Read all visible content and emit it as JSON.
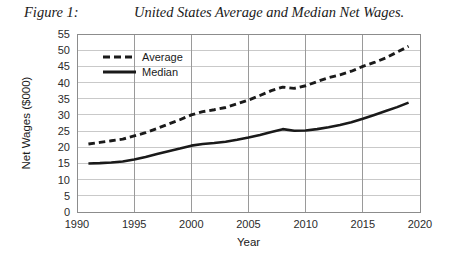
{
  "figure": {
    "label": "Figure 1:",
    "title": "United States Average and Median Net Wages."
  },
  "chart_data": {
    "type": "line",
    "title": "United States Average and Median Net Wages.",
    "xlabel": "Year",
    "ylabel": "Net Wages ($000)",
    "xlim": [
      1990,
      2020
    ],
    "ylim": [
      0,
      55
    ],
    "xticks": [
      1990,
      1995,
      2000,
      2005,
      2010,
      2015,
      2020
    ],
    "yticks": [
      0,
      5,
      10,
      15,
      20,
      25,
      30,
      35,
      40,
      45,
      50,
      55
    ],
    "grid": "both",
    "legend_position": "upper-left-inside",
    "x": [
      1991,
      1992,
      1993,
      1994,
      1995,
      1996,
      1997,
      1998,
      1999,
      2000,
      2001,
      2002,
      2003,
      2004,
      2005,
      2006,
      2007,
      2008,
      2009,
      2010,
      2011,
      2012,
      2013,
      2014,
      2015,
      2016,
      2017,
      2018,
      2019
    ],
    "series": [
      {
        "name": "Average",
        "style": "dashed",
        "color": "#1a1a1a",
        "values": [
          21.0,
          21.5,
          22.0,
          22.5,
          23.5,
          24.5,
          25.8,
          27.2,
          28.5,
          30.0,
          31.0,
          31.6,
          32.3,
          33.4,
          34.6,
          36.0,
          37.5,
          38.6,
          38.2,
          39.0,
          40.3,
          41.5,
          42.4,
          43.5,
          45.0,
          46.2,
          47.6,
          49.4,
          51.2
        ]
      },
      {
        "name": "Median",
        "style": "solid",
        "color": "#1a1a1a",
        "values": [
          15.0,
          15.1,
          15.3,
          15.6,
          16.2,
          17.0,
          17.9,
          18.8,
          19.6,
          20.5,
          21.0,
          21.3,
          21.7,
          22.3,
          23.0,
          23.8,
          24.7,
          25.6,
          25.1,
          25.2,
          25.6,
          26.2,
          26.9,
          27.7,
          28.8,
          30.0,
          31.2,
          32.4,
          33.8
        ]
      }
    ]
  },
  "legend": {
    "items": [
      {
        "label": "Average",
        "style": "dashed"
      },
      {
        "label": "Median",
        "style": "solid"
      }
    ]
  },
  "colors": {
    "line": "#1a1a1a",
    "grid_minor": "#c9c9c9",
    "grid_major": "#9a9a9a",
    "frame": "#8c8c8c",
    "text": "#1a1a1a"
  }
}
